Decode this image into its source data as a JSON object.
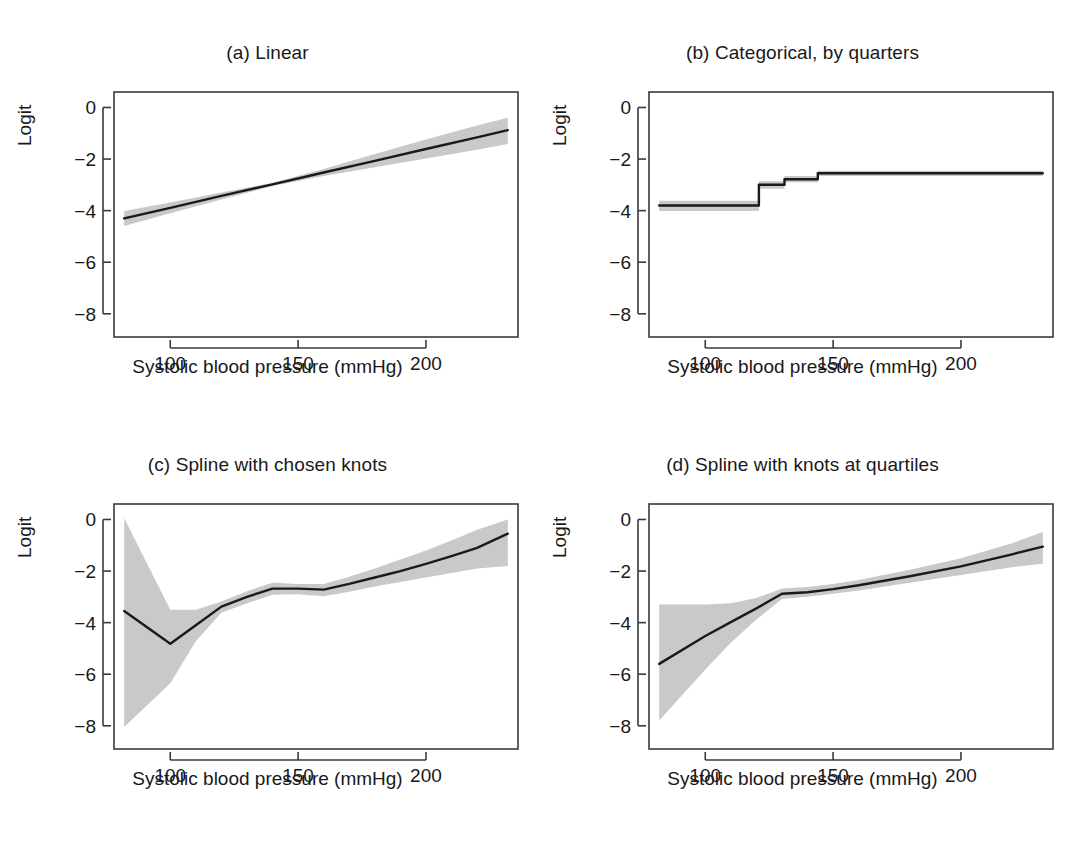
{
  "figure": {
    "axis_label_y": "Logit",
    "axis_label_x": "Systolic blood pressure (mmHg)",
    "line_color": "#1a1a1a",
    "band_color": "#c9c9c9",
    "axis_color": "#3a3a3a",
    "background": "#ffffff"
  },
  "chart_data": [
    {
      "type": "line",
      "panel": "a",
      "title": "(a) Linear",
      "xlabel": "Systolic blood pressure (mmHg)",
      "ylabel": "Logit",
      "xlim": [
        78,
        236
      ],
      "ylim": [
        -8.9,
        0.6
      ],
      "xticks": [
        100,
        150,
        200
      ],
      "yticks": [
        0,
        -2,
        -4,
        -6,
        -8
      ],
      "grid": false,
      "legend": "none",
      "series": [
        {
          "name": "fitted logit",
          "x": [
            82,
            100,
            120,
            140,
            160,
            180,
            200,
            220,
            232
          ],
          "values": [
            -4.3,
            -3.89,
            -3.43,
            -2.98,
            -2.52,
            -2.07,
            -1.61,
            -1.16,
            -0.88
          ]
        },
        {
          "name": "ci_upper",
          "x": [
            82,
            100,
            120,
            140,
            160,
            180,
            200,
            220,
            232
          ],
          "values": [
            -4.02,
            -3.68,
            -3.3,
            -2.92,
            -2.38,
            -1.8,
            -1.24,
            -0.7,
            -0.4
          ]
        },
        {
          "name": "ci_lower",
          "x": [
            82,
            100,
            120,
            140,
            160,
            180,
            200,
            220,
            232
          ],
          "values": [
            -4.6,
            -4.1,
            -3.57,
            -3.05,
            -2.66,
            -2.32,
            -1.98,
            -1.64,
            -1.42
          ]
        }
      ]
    },
    {
      "type": "line",
      "panel": "b",
      "title": "(b) Categorical, by quarters",
      "xlabel": "Systolic blood pressure (mmHg)",
      "ylabel": "Logit",
      "xlim": [
        78,
        236
      ],
      "ylim": [
        -8.9,
        0.6
      ],
      "xticks": [
        100,
        150,
        200
      ],
      "yticks": [
        0,
        -2,
        -4,
        -6,
        -8
      ],
      "grid": false,
      "legend": "none",
      "step_boundaries": [
        82,
        121,
        131,
        144,
        232
      ],
      "series": [
        {
          "name": "fitted logit (step)",
          "values": [
            -3.8,
            -3.0,
            -2.78,
            -2.55
          ]
        },
        {
          "name": "ci_upper (step)",
          "values": [
            -3.62,
            -2.86,
            -2.66,
            -2.45
          ]
        },
        {
          "name": "ci_lower (step)",
          "values": [
            -4.02,
            -3.15,
            -2.9,
            -2.66
          ]
        }
      ]
    },
    {
      "type": "line",
      "panel": "c",
      "title": "(c) Spline with chosen knots",
      "xlabel": "Systolic blood pressure (mmHg)",
      "ylabel": "Logit",
      "xlim": [
        78,
        236
      ],
      "ylim": [
        -8.9,
        0.6
      ],
      "xticks": [
        100,
        150,
        200
      ],
      "yticks": [
        0,
        -2,
        -4,
        -6,
        -8
      ],
      "grid": false,
      "legend": "none",
      "series": [
        {
          "name": "fitted logit",
          "x": [
            82,
            100,
            110,
            120,
            130,
            140,
            150,
            160,
            170,
            180,
            190,
            200,
            210,
            220,
            232
          ],
          "values": [
            -3.55,
            -4.82,
            -4.1,
            -3.38,
            -3.0,
            -2.68,
            -2.68,
            -2.72,
            -2.5,
            -2.25,
            -2.0,
            -1.72,
            -1.42,
            -1.1,
            -0.55
          ]
        },
        {
          "name": "ci_upper",
          "x": [
            82,
            100,
            110,
            120,
            130,
            140,
            150,
            160,
            170,
            180,
            190,
            200,
            210,
            220,
            232
          ],
          "values": [
            0.05,
            -3.5,
            -3.5,
            -3.18,
            -2.78,
            -2.45,
            -2.5,
            -2.5,
            -2.22,
            -1.9,
            -1.55,
            -1.2,
            -0.82,
            -0.4,
            0.0
          ]
        },
        {
          "name": "ci_lower",
          "x": [
            82,
            100,
            110,
            120,
            130,
            140,
            150,
            160,
            170,
            180,
            190,
            200,
            210,
            220,
            232
          ],
          "values": [
            -8.05,
            -6.35,
            -4.72,
            -3.62,
            -3.25,
            -2.92,
            -2.9,
            -2.98,
            -2.8,
            -2.6,
            -2.42,
            -2.25,
            -2.08,
            -1.9,
            -1.8
          ]
        }
      ]
    },
    {
      "type": "line",
      "panel": "d",
      "title": "(d) Spline with knots at quartiles",
      "xlabel": "Systolic blood pressure (mmHg)",
      "ylabel": "Logit",
      "xlim": [
        78,
        236
      ],
      "ylim": [
        -8.9,
        0.6
      ],
      "xticks": [
        100,
        150,
        200
      ],
      "yticks": [
        0,
        -2,
        -4,
        -6,
        -8
      ],
      "grid": false,
      "legend": "none",
      "series": [
        {
          "name": "fitted logit",
          "x": [
            82,
            100,
            110,
            120,
            130,
            140,
            150,
            160,
            180,
            200,
            220,
            232
          ],
          "values": [
            -5.6,
            -4.52,
            -3.98,
            -3.45,
            -2.88,
            -2.82,
            -2.7,
            -2.55,
            -2.2,
            -1.82,
            -1.35,
            -1.05
          ]
        },
        {
          "name": "ci_upper",
          "x": [
            82,
            100,
            110,
            120,
            130,
            140,
            150,
            160,
            180,
            200,
            220,
            232
          ],
          "values": [
            -3.3,
            -3.3,
            -3.25,
            -3.05,
            -2.68,
            -2.62,
            -2.5,
            -2.35,
            -1.95,
            -1.5,
            -0.92,
            -0.48
          ]
        },
        {
          "name": "ci_lower",
          "x": [
            82,
            100,
            110,
            120,
            130,
            140,
            150,
            160,
            180,
            200,
            220,
            232
          ],
          "values": [
            -7.8,
            -5.82,
            -4.78,
            -3.88,
            -3.08,
            -3.0,
            -2.88,
            -2.75,
            -2.45,
            -2.15,
            -1.85,
            -1.72
          ]
        }
      ]
    }
  ]
}
